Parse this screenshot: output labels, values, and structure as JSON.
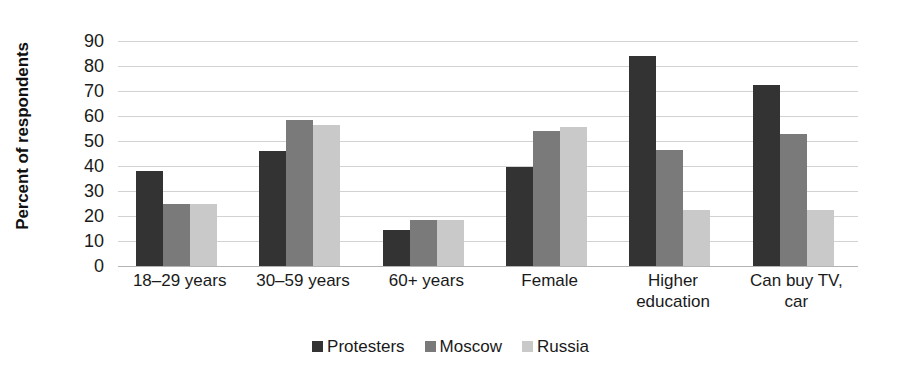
{
  "chart_data": {
    "type": "bar",
    "title": "",
    "xlabel": "",
    "ylabel": "Percent of respondents",
    "ylim": [
      0,
      90
    ],
    "ytick_step": 10,
    "yticks": [
      90,
      80,
      70,
      60,
      50,
      40,
      30,
      20,
      10,
      0
    ],
    "grid": true,
    "legend_position": "bottom",
    "categories": [
      "18–29 years",
      "30–59 years",
      "60+ years",
      "Female",
      "Higher education",
      "Can buy TV, car"
    ],
    "category_lines": [
      [
        "18–29 years"
      ],
      [
        "30–59 years"
      ],
      [
        "60+ years"
      ],
      [
        "Female"
      ],
      [
        "Higher",
        "education"
      ],
      [
        "Can buy TV,",
        "car"
      ]
    ],
    "series": [
      {
        "name": "Protesters",
        "color": "#333333",
        "values": [
          38,
          46,
          14.5,
          39.5,
          84,
          72.5
        ]
      },
      {
        "name": "Moscow",
        "color": "#7a7a7a",
        "values": [
          25,
          58.5,
          18.5,
          54,
          46.5,
          53
        ]
      },
      {
        "name": "Russia",
        "color": "#c9c9c9",
        "values": [
          25,
          56.5,
          18.5,
          55.5,
          22.5,
          22.5
        ]
      }
    ]
  },
  "legend": {
    "items": [
      {
        "label": "Protesters",
        "color": "#333333"
      },
      {
        "label": "Moscow",
        "color": "#7a7a7a"
      },
      {
        "label": "Russia",
        "color": "#c9c9c9"
      }
    ]
  }
}
